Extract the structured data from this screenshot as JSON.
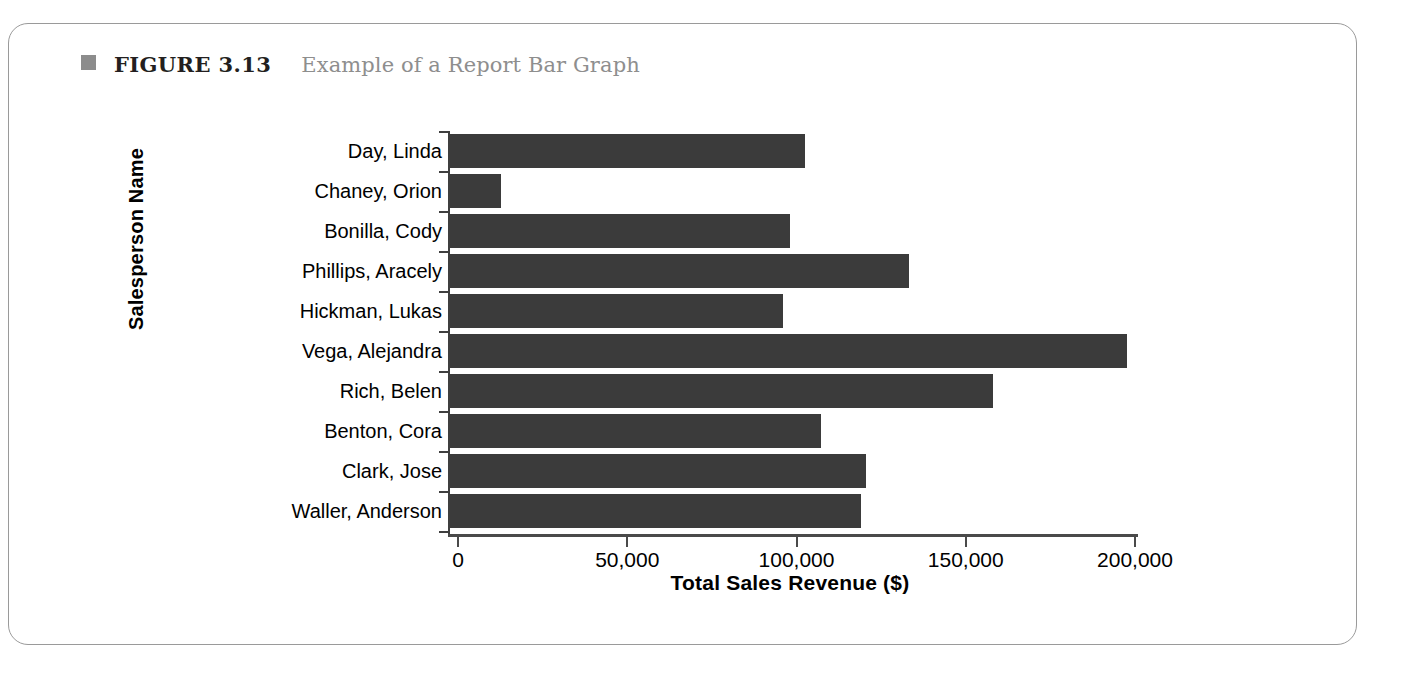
{
  "figure": {
    "bullet_icon": "square-bullet-icon",
    "label": "FIGURE 3.13",
    "title": "Example of a Report Bar Graph",
    "bullet_color": "#8c8c8c",
    "label_color": "#231f20",
    "title_color": "#8e8e8e",
    "card_border_color": "#9a9a9a"
  },
  "chart_data": {
    "type": "bar",
    "orientation": "horizontal",
    "title": "Example of a Report Bar Graph",
    "xlabel": "Total Sales Revenue ($)",
    "ylabel": "Salesperson Name",
    "categories": [
      "Day, Linda",
      "Chaney, Orion",
      "Bonilla, Cody",
      "Phillips, Aracely",
      "Hickman, Lukas",
      "Vega, Alejandra",
      "Rich, Belen",
      "Benton, Cora",
      "Clark, Jose",
      "Waller, Anderson"
    ],
    "values": [
      105000,
      15000,
      100500,
      135500,
      98500,
      200000,
      160500,
      109500,
      123000,
      121500
    ],
    "xlim": [
      0,
      200000
    ],
    "xticks": [
      0,
      50000,
      100000,
      150000,
      200000
    ],
    "xtick_labels": [
      "0",
      "50,000",
      "100,000",
      "150,000",
      "200,000"
    ],
    "grid": false,
    "legend": null,
    "bar_color": "#3b3b3b",
    "axis_color": "#4a4a4a"
  }
}
